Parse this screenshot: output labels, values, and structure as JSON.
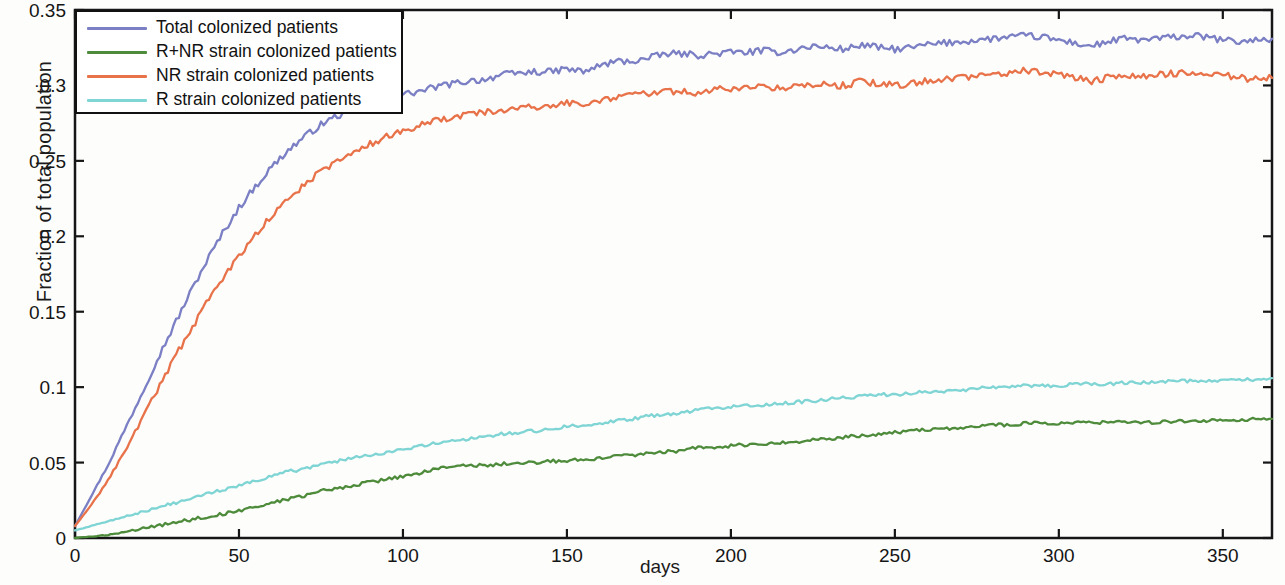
{
  "chart_data": {
    "type": "line",
    "title": "",
    "xlabel": "days",
    "ylabel": "Fraction of total population",
    "xlim": [
      0,
      365
    ],
    "ylim": [
      0,
      0.35
    ],
    "xticks": [
      0,
      50,
      100,
      150,
      200,
      250,
      300,
      350
    ],
    "xtick_labels": [
      "0",
      "50",
      "100",
      "150",
      "200",
      "250",
      "300",
      "350"
    ],
    "yticks": [
      0,
      0.05,
      0.1,
      0.15,
      0.2,
      0.25,
      0.3,
      0.35
    ],
    "ytick_labels": [
      "0",
      "0.05",
      "0.1",
      "0.15",
      "0.2",
      "0.25",
      "0.3",
      "0.35"
    ],
    "grid": false,
    "legend_position": "upper left",
    "series": [
      {
        "name": "Total colonized patients",
        "color": "#7b7fc4",
        "x": [
          0,
          5,
          10,
          15,
          20,
          25,
          30,
          35,
          40,
          45,
          50,
          55,
          60,
          65,
          70,
          75,
          80,
          85,
          90,
          95,
          100,
          105,
          110,
          115,
          120,
          125,
          130,
          135,
          140,
          145,
          150,
          155,
          160,
          165,
          170,
          175,
          180,
          185,
          190,
          195,
          200,
          205,
          210,
          215,
          220,
          225,
          230,
          235,
          240,
          245,
          250,
          255,
          260,
          265,
          270,
          275,
          280,
          285,
          290,
          295,
          300,
          305,
          310,
          315,
          320,
          325,
          330,
          335,
          340,
          345,
          350,
          355,
          360,
          365
        ],
        "values": [
          0.008,
          0.028,
          0.048,
          0.071,
          0.094,
          0.118,
          0.14,
          0.162,
          0.183,
          0.202,
          0.219,
          0.233,
          0.246,
          0.257,
          0.266,
          0.274,
          0.28,
          0.283,
          0.288,
          0.292,
          0.294,
          0.296,
          0.299,
          0.301,
          0.303,
          0.304,
          0.307,
          0.308,
          0.309,
          0.309,
          0.311,
          0.309,
          0.313,
          0.316,
          0.316,
          0.318,
          0.321,
          0.321,
          0.32,
          0.321,
          0.322,
          0.322,
          0.323,
          0.322,
          0.324,
          0.326,
          0.325,
          0.324,
          0.327,
          0.325,
          0.324,
          0.325,
          0.327,
          0.328,
          0.329,
          0.33,
          0.331,
          0.332,
          0.333,
          0.332,
          0.33,
          0.328,
          0.326,
          0.329,
          0.331,
          0.33,
          0.331,
          0.332,
          0.333,
          0.332,
          0.33,
          0.329,
          0.33,
          0.331
        ]
      },
      {
        "name": "R+NR strain colonized patients",
        "color": "#4e8c3c",
        "x": [
          0,
          5,
          10,
          15,
          20,
          25,
          30,
          35,
          40,
          45,
          50,
          55,
          60,
          65,
          70,
          75,
          80,
          85,
          90,
          95,
          100,
          105,
          110,
          115,
          120,
          125,
          130,
          135,
          140,
          145,
          150,
          155,
          160,
          165,
          170,
          175,
          180,
          185,
          190,
          195,
          200,
          205,
          210,
          215,
          220,
          225,
          230,
          235,
          240,
          245,
          250,
          255,
          260,
          265,
          270,
          275,
          280,
          285,
          290,
          295,
          300,
          305,
          310,
          315,
          320,
          325,
          330,
          335,
          340,
          345,
          350,
          355,
          360,
          365
        ],
        "values": [
          0.0,
          0.001,
          0.002,
          0.004,
          0.006,
          0.008,
          0.01,
          0.012,
          0.014,
          0.016,
          0.018,
          0.021,
          0.023,
          0.026,
          0.028,
          0.031,
          0.033,
          0.035,
          0.037,
          0.039,
          0.041,
          0.043,
          0.046,
          0.047,
          0.048,
          0.048,
          0.049,
          0.05,
          0.05,
          0.051,
          0.051,
          0.052,
          0.053,
          0.054,
          0.055,
          0.056,
          0.057,
          0.058,
          0.06,
          0.06,
          0.061,
          0.062,
          0.062,
          0.063,
          0.064,
          0.065,
          0.066,
          0.067,
          0.068,
          0.069,
          0.07,
          0.071,
          0.072,
          0.072,
          0.073,
          0.074,
          0.075,
          0.075,
          0.076,
          0.076,
          0.076,
          0.077,
          0.076,
          0.077,
          0.077,
          0.076,
          0.077,
          0.077,
          0.078,
          0.078,
          0.078,
          0.078,
          0.079,
          0.079
        ]
      },
      {
        "name": "NR strain colonized patients",
        "color": "#e8734a",
        "x": [
          0,
          5,
          10,
          15,
          20,
          25,
          30,
          35,
          40,
          45,
          50,
          55,
          60,
          65,
          70,
          75,
          80,
          85,
          90,
          95,
          100,
          105,
          110,
          115,
          120,
          125,
          130,
          135,
          140,
          145,
          150,
          155,
          160,
          165,
          170,
          175,
          180,
          185,
          190,
          195,
          200,
          205,
          210,
          215,
          220,
          225,
          230,
          235,
          240,
          245,
          250,
          255,
          260,
          265,
          270,
          275,
          280,
          285,
          290,
          295,
          300,
          305,
          310,
          315,
          320,
          325,
          330,
          335,
          340,
          345,
          350,
          355,
          360,
          365
        ],
        "values": [
          0.008,
          0.022,
          0.038,
          0.057,
          0.077,
          0.098,
          0.118,
          0.137,
          0.155,
          0.172,
          0.187,
          0.201,
          0.214,
          0.225,
          0.234,
          0.243,
          0.25,
          0.256,
          0.261,
          0.266,
          0.27,
          0.273,
          0.277,
          0.279,
          0.281,
          0.282,
          0.284,
          0.285,
          0.286,
          0.286,
          0.289,
          0.287,
          0.29,
          0.292,
          0.293,
          0.295,
          0.296,
          0.296,
          0.295,
          0.297,
          0.298,
          0.298,
          0.299,
          0.298,
          0.3,
          0.301,
          0.3,
          0.3,
          0.303,
          0.301,
          0.3,
          0.301,
          0.303,
          0.304,
          0.305,
          0.306,
          0.307,
          0.308,
          0.31,
          0.309,
          0.307,
          0.305,
          0.303,
          0.305,
          0.307,
          0.306,
          0.307,
          0.308,
          0.309,
          0.309,
          0.307,
          0.305,
          0.304,
          0.305
        ]
      },
      {
        "name": "R strain colonized patients",
        "color": "#7fd4d4",
        "x": [
          0,
          5,
          10,
          15,
          20,
          25,
          30,
          35,
          40,
          45,
          50,
          55,
          60,
          65,
          70,
          75,
          80,
          85,
          90,
          95,
          100,
          105,
          110,
          115,
          120,
          125,
          130,
          135,
          140,
          145,
          150,
          155,
          160,
          165,
          170,
          175,
          180,
          185,
          190,
          195,
          200,
          205,
          210,
          215,
          220,
          225,
          230,
          235,
          240,
          245,
          250,
          255,
          260,
          265,
          270,
          275,
          280,
          285,
          290,
          295,
          300,
          305,
          310,
          315,
          320,
          325,
          330,
          335,
          340,
          345,
          350,
          355,
          360,
          365
        ],
        "values": [
          0.005,
          0.008,
          0.011,
          0.014,
          0.017,
          0.02,
          0.023,
          0.026,
          0.029,
          0.032,
          0.035,
          0.038,
          0.041,
          0.044,
          0.046,
          0.049,
          0.051,
          0.053,
          0.055,
          0.057,
          0.059,
          0.061,
          0.063,
          0.064,
          0.066,
          0.067,
          0.069,
          0.07,
          0.071,
          0.072,
          0.074,
          0.075,
          0.076,
          0.078,
          0.079,
          0.081,
          0.082,
          0.083,
          0.085,
          0.086,
          0.087,
          0.088,
          0.088,
          0.089,
          0.09,
          0.091,
          0.092,
          0.093,
          0.094,
          0.095,
          0.095,
          0.096,
          0.097,
          0.097,
          0.098,
          0.099,
          0.1,
          0.1,
          0.101,
          0.101,
          0.101,
          0.102,
          0.102,
          0.102,
          0.103,
          0.103,
          0.103,
          0.104,
          0.104,
          0.104,
          0.105,
          0.105,
          0.105,
          0.106
        ]
      }
    ]
  },
  "legend": {
    "items": [
      {
        "label": "Total colonized patients",
        "color": "#7b7fc4"
      },
      {
        "label": "R+NR strain colonized patients",
        "color": "#4e8c3c"
      },
      {
        "label": "NR strain colonized patients",
        "color": "#e8734a"
      },
      {
        "label": "R strain colonized patients",
        "color": "#7fd4d4"
      }
    ]
  },
  "axes": {
    "x_title": "days",
    "y_title": "Fraction of total population"
  }
}
